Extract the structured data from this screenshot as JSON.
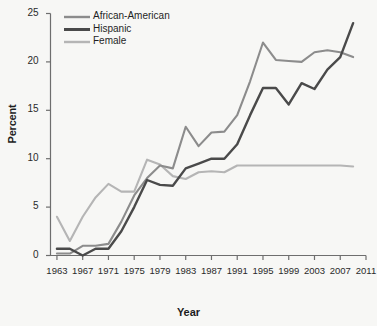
{
  "chart_data": {
    "type": "line",
    "title": "",
    "subtitle": "",
    "xlabel": "Year",
    "ylabel": "Percent",
    "xlim": [
      1962,
      2011
    ],
    "ylim": [
      0,
      25
    ],
    "grid": false,
    "legend_position": "top-left",
    "xticks": [
      "1963",
      "1967",
      "1971",
      "1975",
      "1979",
      "1983",
      "1987",
      "1991",
      "1995",
      "1999",
      "2003",
      "2007",
      "2011"
    ],
    "yticks": [
      "0",
      "5",
      "10",
      "15",
      "20",
      "25"
    ],
    "x": [
      1963,
      1965,
      1967,
      1969,
      1971,
      1973,
      1975,
      1977,
      1979,
      1981,
      1983,
      1985,
      1987,
      1989,
      1991,
      1993,
      1995,
      1997,
      1999,
      2001,
      2003,
      2005,
      2007,
      2009
    ],
    "series": [
      {
        "name": "African-American",
        "color": "#8c8c8c",
        "values": [
          0.2,
          0.2,
          1.0,
          1.0,
          1.2,
          3.5,
          6.2,
          8.0,
          9.3,
          9.0,
          13.3,
          11.3,
          12.7,
          12.8,
          14.5,
          18.0,
          22.0,
          20.2,
          20.1,
          20.0,
          21.0,
          21.2,
          21.0,
          20.5
        ]
      },
      {
        "name": "Hispanic",
        "color": "#4a4a4a",
        "values": [
          0.7,
          0.7,
          0.0,
          0.7,
          0.7,
          2.5,
          5.0,
          7.8,
          7.3,
          7.2,
          9.0,
          9.5,
          10.0,
          10.0,
          11.5,
          14.5,
          17.3,
          17.3,
          15.6,
          17.8,
          17.2,
          19.2,
          20.5,
          24.0
        ]
      },
      {
        "name": "Female",
        "color": "#b5b5b5",
        "values": [
          4.0,
          1.5,
          4.0,
          6.0,
          7.4,
          6.6,
          6.6,
          9.9,
          9.4,
          8.2,
          7.9,
          8.6,
          8.7,
          8.6,
          9.3,
          9.3,
          9.3,
          9.3,
          9.3,
          9.3,
          9.3,
          9.3,
          9.3,
          9.2
        ]
      }
    ]
  },
  "legend": {
    "entries": [
      {
        "label": "African-American"
      },
      {
        "label": "Hispanic"
      },
      {
        "label": "Female"
      }
    ]
  },
  "axes": {
    "y_title": "Percent",
    "x_title": "Year"
  }
}
